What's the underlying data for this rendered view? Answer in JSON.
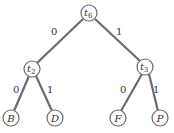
{
  "diagram": {
    "type": "binary-tree",
    "nodes": [
      {
        "id": "t6",
        "label": "t",
        "sub": "6",
        "x": 89,
        "y": 13
      },
      {
        "id": "t2",
        "label": "t",
        "sub": "2",
        "x": 32,
        "y": 69
      },
      {
        "id": "t3",
        "label": "t",
        "sub": "3",
        "x": 145,
        "y": 67
      },
      {
        "id": "B",
        "label": "B",
        "sub": "",
        "x": 11,
        "y": 118
      },
      {
        "id": "D",
        "label": "D",
        "sub": "",
        "x": 55,
        "y": 118
      },
      {
        "id": "F",
        "label": "F",
        "sub": "",
        "x": 118,
        "y": 118
      },
      {
        "id": "P",
        "label": "P",
        "sub": "",
        "x": 160,
        "y": 118
      }
    ],
    "edges": [
      {
        "from": "t6",
        "to": "t2",
        "label": "0"
      },
      {
        "from": "t6",
        "to": "t3",
        "label": "1"
      },
      {
        "from": "t2",
        "to": "B",
        "label": "0"
      },
      {
        "from": "t2",
        "to": "D",
        "label": "1"
      },
      {
        "from": "t3",
        "to": "F",
        "label": "0"
      },
      {
        "from": "t3",
        "to": "P",
        "label": "1"
      }
    ]
  }
}
